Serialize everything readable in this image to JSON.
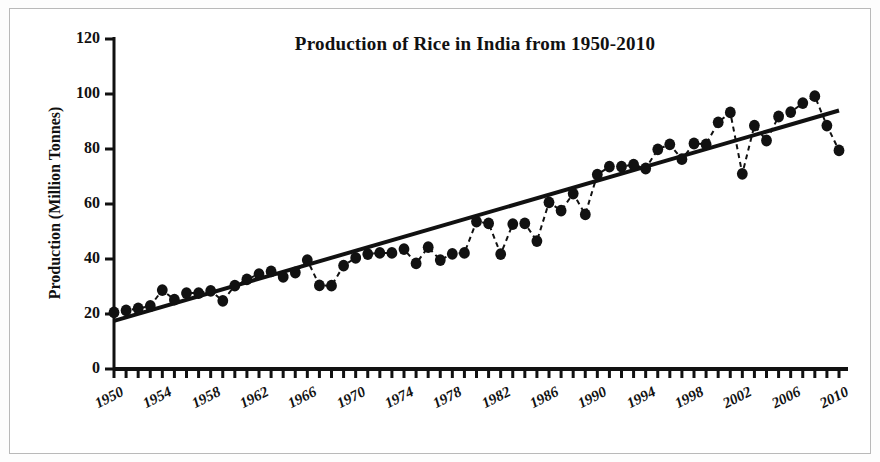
{
  "chart_data": {
    "type": "line",
    "title": "Production of Rice in India from 1950-2010",
    "xlabel": "",
    "ylabel": "Production (Million Tonnes)",
    "ylim": [
      0,
      120
    ],
    "xlim": [
      1950,
      2010
    ],
    "y_ticks": [
      0,
      20,
      40,
      60,
      80,
      100,
      120
    ],
    "x_ticks": [
      1950,
      1954,
      1958,
      1962,
      1966,
      1970,
      1974,
      1978,
      1982,
      1986,
      1990,
      1994,
      1998,
      2002,
      2006,
      2010
    ],
    "x_minor_tick_interval": 1,
    "grid": false,
    "legend": null,
    "marker": "filled-circle",
    "line_style": "dashed",
    "series": [
      {
        "name": "Rice production",
        "x": [
          1950,
          1951,
          1952,
          1953,
          1954,
          1955,
          1956,
          1957,
          1958,
          1959,
          1960,
          1961,
          1962,
          1963,
          1964,
          1965,
          1966,
          1967,
          1968,
          1969,
          1970,
          1971,
          1972,
          1973,
          1974,
          1975,
          1976,
          1977,
          1978,
          1979,
          1980,
          1981,
          1982,
          1983,
          1984,
          1985,
          1986,
          1987,
          1988,
          1989,
          1990,
          1991,
          1992,
          1993,
          1994,
          1995,
          1996,
          1997,
          1998,
          1999,
          2000,
          2001,
          2002,
          2003,
          2004,
          2005,
          2006,
          2007,
          2008,
          2009,
          2010
        ],
        "values": [
          20.6,
          21.3,
          22.0,
          22.9,
          28.7,
          25.2,
          27.6,
          27.6,
          28.4,
          24.8,
          30.3,
          32.6,
          34.5,
          35.5,
          33.5,
          35.1,
          39.6,
          30.4,
          30.3,
          37.6,
          40.4,
          41.8,
          42.2,
          42.2,
          43.6,
          38.4,
          44.3,
          39.6,
          41.9,
          42.2,
          53.6,
          53.0,
          41.8,
          52.7,
          53.0,
          46.5,
          60.6,
          57.6,
          63.8,
          56.2,
          70.7,
          73.6,
          73.6,
          74.3,
          72.9,
          79.9,
          81.7,
          76.3,
          82.0,
          81.7,
          89.7,
          93.3,
          71.0,
          88.5,
          83.1,
          91.8,
          93.4,
          96.7,
          99.2,
          88.5,
          79.5
        ]
      }
    ],
    "trend_line": {
      "name": "Linear trend",
      "style": "solid",
      "x_start": 1950,
      "y_start": 17.5,
      "x_end": 2010,
      "y_end": 94.0
    }
  },
  "figure": {
    "background": "#ffffff",
    "border_color": "#b9b9b9",
    "ink_color": "#111111"
  }
}
